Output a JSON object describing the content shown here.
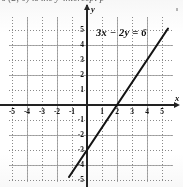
{
  "header": {
    "cut_off_text": "s (2, 0) is the y-intercept p"
  },
  "equation": {
    "full": "3x − 2y = 6",
    "lhs_a": "3x",
    "operator": "−",
    "lhs_b": "2y",
    "equals": "=",
    "rhs": "6"
  },
  "axes": {
    "x_label": "x",
    "y_label": "y",
    "x_ticks": [
      "-5",
      "-4",
      "-3",
      "-2",
      "-1",
      "1",
      "2",
      "3",
      "4",
      "5"
    ],
    "y_ticks": [
      "5",
      "4",
      "3",
      "2",
      "1",
      "-1",
      "-2",
      "-3",
      "-4",
      "-5"
    ]
  },
  "colors": {
    "ink": "#1a1a1a",
    "axis": "#222222",
    "grid_minor": "#8a8a8a",
    "grid_major": "#9b9b9b",
    "paper": "#ffffff"
  },
  "chart_data": {
    "type": "line",
    "title": "3x − 2y = 6",
    "xlabel": "x",
    "ylabel": "y",
    "xlim": [
      -5.8,
      5.6
    ],
    "ylim": [
      -5.9,
      5.2
    ],
    "grid": true,
    "legend": "none",
    "xticks": [
      -5,
      -4,
      -3,
      -2,
      -1,
      1,
      2,
      3,
      4,
      5
    ],
    "yticks": [
      5,
      4,
      3,
      2,
      1,
      -1,
      -2,
      -3,
      -4,
      -5
    ],
    "series": [
      {
        "name": "3x - 2y = 6",
        "equation": "y = 1.5x - 3",
        "slope": 1.5,
        "intercept": -3,
        "x_intercept": 2,
        "y_intercept": -3,
        "x": [
          -1.2,
          5.4
        ],
        "y": [
          -4.8,
          5.1
        ],
        "points": [
          {
            "x": 0,
            "y": -3
          },
          {
            "x": 2,
            "y": 0
          },
          {
            "x": 4,
            "y": 3
          }
        ]
      }
    ],
    "annotations": [
      {
        "text": "3x − 2y = 6",
        "x": 1.0,
        "y": 5.0
      }
    ]
  }
}
